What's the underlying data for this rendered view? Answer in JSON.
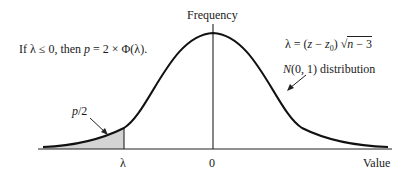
{
  "diagram": {
    "y_axis_label": "Frequency",
    "x_axis_label": "Value",
    "condition": {
      "prefix": "If λ ≤ 0, then ",
      "p": "p",
      "rest": " = 2 × Φ(λ)."
    },
    "lambda_formula": {
      "lhs": "λ = (",
      "z": "z",
      "minus": " − ",
      "z0": "z",
      "z0_sub": "0",
      "close": ") ",
      "sqrt": "√",
      "n": "n",
      "tail": " − 3"
    },
    "distribution_label": {
      "N": "N",
      "rest": "(0, 1) distribution"
    },
    "shaded_label": {
      "p": "p",
      "rest": "/2"
    },
    "ticks": {
      "lambda": "λ",
      "zero": "0"
    },
    "colors": {
      "curve": "#111111",
      "shade": "#d4d4d4",
      "axis": "#222222"
    }
  }
}
